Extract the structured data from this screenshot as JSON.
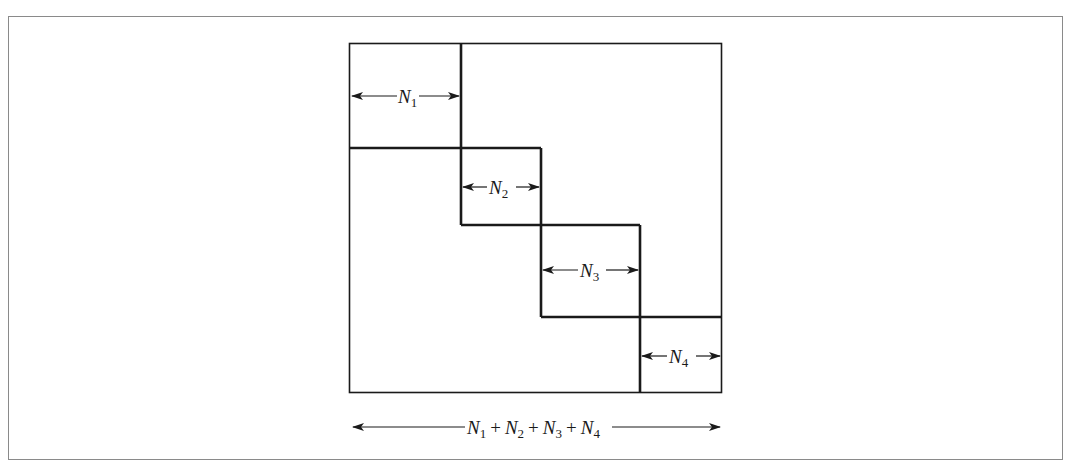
{
  "diagram": {
    "colors": {
      "frame": "#8a8a8a",
      "line": "#1a1a1a",
      "background": "#ffffff"
    },
    "blocks": [
      {
        "id": "N1",
        "var": "N",
        "sub": "1"
      },
      {
        "id": "N2",
        "var": "N",
        "sub": "2"
      },
      {
        "id": "N3",
        "var": "N",
        "sub": "3"
      },
      {
        "id": "N4",
        "var": "N",
        "sub": "4"
      }
    ],
    "total": {
      "terms": [
        {
          "var": "N",
          "sub": "1"
        },
        {
          "var": "N",
          "sub": "2"
        },
        {
          "var": "N",
          "sub": "3"
        },
        {
          "var": "N",
          "sub": "4"
        }
      ],
      "operator": "+"
    }
  }
}
